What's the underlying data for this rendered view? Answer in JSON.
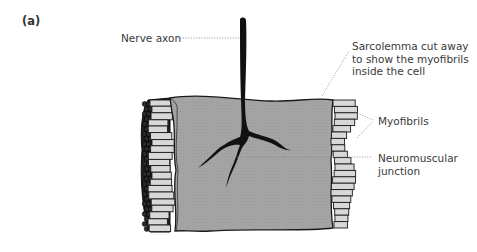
{
  "figure": {
    "panel_label": "(a)",
    "labels": {
      "nerve_axon": "Nerve axon",
      "sarcolemma": [
        "Sarcolemma cut away",
        "to show the myofibrils",
        "inside the cell"
      ],
      "myofibrils": "Myofibrils",
      "neuromuscular_junction": [
        "Neuromuscular",
        "junction"
      ]
    },
    "colors": {
      "sarcolemma_fill": "#a4a4a4",
      "myofibril_fill": "#d8d8d8",
      "outline": "#1a1a1a",
      "axon": "#111111",
      "label_text": "#3a3a3a",
      "leader_line": "#8a8a8a"
    }
  }
}
